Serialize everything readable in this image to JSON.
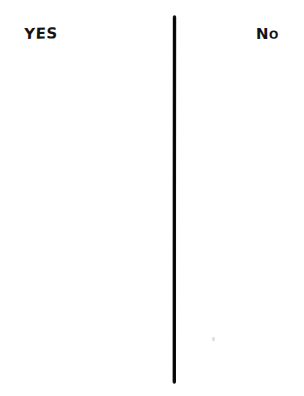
{
  "page": {
    "background_color": "#ffffff",
    "width": 304,
    "height": 396
  },
  "columns": [
    {
      "id": "yes",
      "heading": "YES",
      "side": "left",
      "entries": []
    },
    {
      "id": "no",
      "heading": "No",
      "side": "right",
      "entries": []
    }
  ],
  "divider": {
    "name": "vertical-divider-line",
    "orientation": "vertical",
    "color": "#111111",
    "stroke_width": 3.4,
    "x": 174,
    "y_top": 17,
    "y_bottom": 382
  },
  "artifacts": {
    "speck": {
      "name": "paper-speck",
      "color": "#c9c9c9",
      "x": 213,
      "y": 339
    }
  },
  "ink_color": "#141414"
}
